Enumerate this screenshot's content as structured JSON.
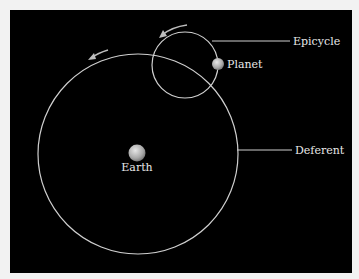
{
  "diagram": {
    "colors": {
      "background": "#000000",
      "frame": "#f2f2f2",
      "lines": "#d0d0d0",
      "text": "#e8e8e8",
      "bodies": "#bdbdbd"
    },
    "labels": {
      "epicycle": "Epicycle",
      "planet": "Planet",
      "deferent": "Deferent",
      "earth": "Earth"
    },
    "icons": {
      "deferent_direction": "counterclockwise-arrow",
      "epicycle_direction": "counterclockwise-arrow"
    }
  }
}
